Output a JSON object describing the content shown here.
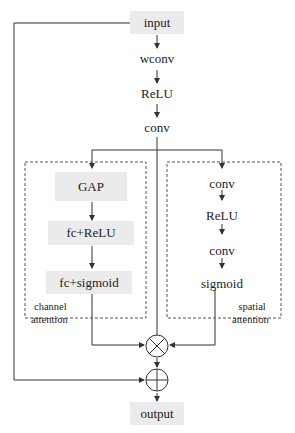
{
  "diagram": {
    "type": "attention-module-flowchart",
    "main_path": {
      "input": "input",
      "wconv": "wconv",
      "relu": "ReLU",
      "conv": "conv",
      "output": "output"
    },
    "channel_attention": {
      "label_line1": "channel",
      "label_line2": "attention",
      "blocks": [
        "GAP",
        "fc+ReLU",
        "fc+sigmoid"
      ]
    },
    "spatial_attention": {
      "label_line1": "spatial",
      "label_line2": "attention",
      "blocks": [
        "conv",
        "ReLU",
        "conv",
        "sigmoid"
      ]
    },
    "operators": {
      "multiply": "⊗",
      "add": "⊕"
    },
    "colors": {
      "box_fill": "#ebebeb",
      "line": "#333333",
      "dashed_border": "#555555"
    }
  }
}
